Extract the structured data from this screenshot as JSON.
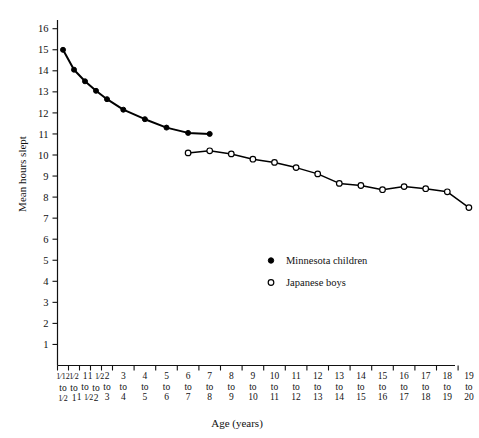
{
  "chart_data": {
    "type": "line",
    "title": "",
    "xlabel": "Age (years)",
    "ylabel": "Mean hours slept",
    "ylim": [
      0,
      16
    ],
    "yticks": [
      1,
      2,
      3,
      4,
      5,
      6,
      7,
      8,
      9,
      10,
      11,
      12,
      13,
      14,
      15,
      16
    ],
    "grid": false,
    "legend_position": "center",
    "categories": [
      "1/12 to 1/2",
      "1/2 to 1",
      "1 to 1 1/2",
      "1 1/2 to 2",
      "2 to 3",
      "3 to 4",
      "4 to 5",
      "5 to 6",
      "6 to 7",
      "7 to 8",
      "8 to 9",
      "9 to 10",
      "10 to 11",
      "11 to 12",
      "12 to 13",
      "13 to 14",
      "14 to 15",
      "15 to 16",
      "16 to 17",
      "17 to 18",
      "18 to 19",
      "19 to 20"
    ],
    "category_labels": [
      {
        "top": "1/12",
        "mid": "to",
        "bot": "1/2"
      },
      {
        "top": "1/2",
        "mid": "to",
        "bot": "1"
      },
      {
        "top": "1",
        "mid": "to",
        "bot": "1 1/2"
      },
      {
        "top": "1 1/2",
        "mid": "to",
        "bot": "2"
      },
      {
        "top": "2",
        "mid": "to",
        "bot": "3"
      },
      {
        "top": "3",
        "mid": "to",
        "bot": "4"
      },
      {
        "top": "4",
        "mid": "to",
        "bot": "5"
      },
      {
        "top": "5",
        "mid": "to",
        "bot": "6"
      },
      {
        "top": "6",
        "mid": "to",
        "bot": "7"
      },
      {
        "top": "7",
        "mid": "to",
        "bot": "8"
      },
      {
        "top": "8",
        "mid": "to",
        "bot": "9"
      },
      {
        "top": "9",
        "mid": "to",
        "bot": "10"
      },
      {
        "top": "10",
        "mid": "to",
        "bot": "11"
      },
      {
        "top": "11",
        "mid": "to",
        "bot": "12"
      },
      {
        "top": "12",
        "mid": "to",
        "bot": "13"
      },
      {
        "top": "13",
        "mid": "to",
        "bot": "14"
      },
      {
        "top": "14",
        "mid": "to",
        "bot": "15"
      },
      {
        "top": "15",
        "mid": "to",
        "bot": "16"
      },
      {
        "top": "16",
        "mid": "to",
        "bot": "17"
      },
      {
        "top": "17",
        "mid": "to",
        "bot": "18"
      },
      {
        "top": "18",
        "mid": "to",
        "bot": "19"
      },
      {
        "top": "19",
        "mid": "to",
        "bot": "20"
      }
    ],
    "series": [
      {
        "name": "Minnesota children",
        "marker": "filled-circle",
        "color": "#000000",
        "points": [
          {
            "category": "1/12 to 1/2",
            "value": 15.0
          },
          {
            "category": "1/2 to 1",
            "value": 14.05
          },
          {
            "category": "1 to 1 1/2",
            "value": 13.5
          },
          {
            "category": "1 1/2 to 2",
            "value": 13.05
          },
          {
            "category": "2 to 3",
            "value": 12.65
          },
          {
            "category": "3 to 4",
            "value": 12.15
          },
          {
            "category": "4 to 5",
            "value": 11.7
          },
          {
            "category": "5 to 6",
            "value": 11.3
          },
          {
            "category": "6 to 7",
            "value": 11.05
          },
          {
            "category": "7 to 8",
            "value": 11.0
          }
        ]
      },
      {
        "name": "Japanese boys",
        "marker": "open-circle",
        "color": "#000000",
        "points": [
          {
            "category": "6 to 7",
            "value": 10.1
          },
          {
            "category": "7 to 8",
            "value": 10.2
          },
          {
            "category": "8 to 9",
            "value": 10.05
          },
          {
            "category": "9 to 10",
            "value": 9.8
          },
          {
            "category": "10 to 11",
            "value": 9.65
          },
          {
            "category": "11 to 12",
            "value": 9.4
          },
          {
            "category": "12 to 13",
            "value": 9.1
          },
          {
            "category": "13 to 14",
            "value": 8.65
          },
          {
            "category": "14 to 15",
            "value": 8.55
          },
          {
            "category": "15 to 16",
            "value": 8.35
          },
          {
            "category": "16 to 17",
            "value": 8.5
          },
          {
            "category": "17 to 18",
            "value": 8.4
          },
          {
            "category": "18 to 19",
            "value": 8.25
          },
          {
            "category": "19 to 20",
            "value": 7.5
          }
        ]
      }
    ],
    "legend": [
      {
        "label": "Minnesota children",
        "marker": "filled-circle"
      },
      {
        "label": "Japanese boys",
        "marker": "open-circle"
      }
    ]
  }
}
